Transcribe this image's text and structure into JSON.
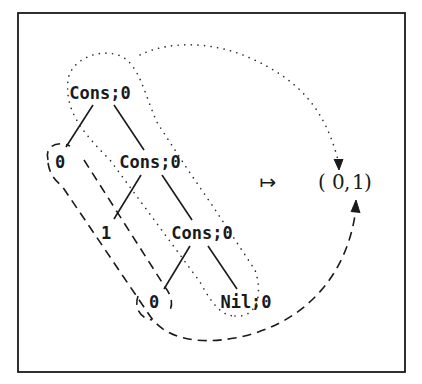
{
  "diagram": {
    "tree": {
      "root": {
        "label": "Cons;0"
      },
      "left_leaf_0": {
        "label": "0"
      },
      "cons_mid": {
        "label": "Cons;0"
      },
      "leaf_1": {
        "label": "1"
      },
      "cons_low": {
        "label": "Cons;0"
      },
      "leaf_0_bottom": {
        "label": "0"
      },
      "nil": {
        "label": "Nil;0"
      }
    },
    "mapsto_symbol": "↦",
    "result": {
      "open": "(",
      "first": "0",
      "sep": ",",
      "second": "1",
      "close": ")"
    },
    "colors": {
      "ink": "#1a1a1a",
      "background": "#ffffff"
    }
  }
}
